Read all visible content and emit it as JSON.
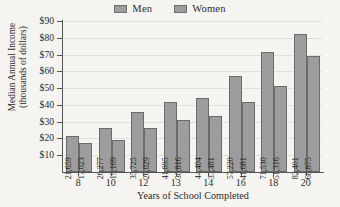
{
  "chart_data": {
    "type": "bar",
    "title": "",
    "xlabel": "Years of School Completed",
    "ylabel_line1": "Median Annual Income",
    "ylabel_line2": "(thousands of dollars)",
    "categories": [
      "8",
      "10",
      "12",
      "13",
      "14",
      "16",
      "18",
      "20"
    ],
    "series": [
      {
        "name": "Men",
        "color": "#9d9d9d",
        "values": [
          21659,
          26277,
          35725,
          41895,
          44404,
          57220,
          71530,
          82401
        ],
        "labels": [
          "21,659",
          "26,277",
          "35,725",
          "41,895",
          "44,404",
          "57,220",
          "71,530",
          "82,401"
        ]
      },
      {
        "name": "Women",
        "color": "#9d9d9d",
        "values": [
          17023,
          19169,
          26029,
          30816,
          33481,
          41681,
          51316,
          68875
        ],
        "labels": [
          "17,023",
          "19,169",
          "26,029",
          "30,816",
          "33,481",
          "41,681",
          "51,316",
          "68,875"
        ]
      }
    ],
    "ylim": [
      0,
      90
    ],
    "ytick_values": [
      90,
      80,
      70,
      60,
      50,
      40,
      30,
      20,
      10
    ],
    "ytick_labels": [
      "$90",
      "$80",
      "$70",
      "$60",
      "$50",
      "$40",
      "$30",
      "$20",
      "$10"
    ],
    "y_units": "thousands of dollars",
    "grid": true,
    "legend_position": "top-center",
    "legend": [
      "Men",
      "Women"
    ],
    "axis_color": "#545454",
    "grid_color": "#e2dfdb",
    "background_color": "#f6f4f1"
  }
}
